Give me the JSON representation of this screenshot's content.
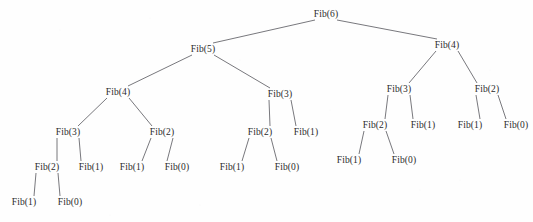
{
  "diagram": {
    "type": "recursion-tree",
    "background_color": "#fefefe",
    "text_color": "#2b2b2b",
    "edge_color": "#56565c",
    "nodes": [
      {
        "id": "n0",
        "label": "Fib(6)",
        "x": 326,
        "y": 14,
        "level": 0
      },
      {
        "id": "n1",
        "label": "Fib(5)",
        "x": 203,
        "y": 49,
        "level": 1
      },
      {
        "id": "n2",
        "label": "Fib(4)",
        "x": 447,
        "y": 45,
        "level": 1
      },
      {
        "id": "n3",
        "label": "Fib(4)",
        "x": 118,
        "y": 92,
        "level": 2
      },
      {
        "id": "n4",
        "label": "Fib(3)",
        "x": 280,
        "y": 94,
        "level": 2
      },
      {
        "id": "n5",
        "label": "Fib(3)",
        "x": 399,
        "y": 89,
        "level": 2
      },
      {
        "id": "n6",
        "label": "Fib(2)",
        "x": 487,
        "y": 89,
        "level": 2
      },
      {
        "id": "n7",
        "label": "Fib(3)",
        "x": 68,
        "y": 132,
        "level": 3
      },
      {
        "id": "n8",
        "label": "Fib(2)",
        "x": 162,
        "y": 132,
        "level": 3
      },
      {
        "id": "n9",
        "label": "Fib(2)",
        "x": 260,
        "y": 132,
        "level": 3
      },
      {
        "id": "n10",
        "label": "Fib(1)",
        "x": 306,
        "y": 132,
        "level": 3
      },
      {
        "id": "n11",
        "label": "Fib(2)",
        "x": 375,
        "y": 125,
        "level": 3
      },
      {
        "id": "n12",
        "label": "Fib(1)",
        "x": 423,
        "y": 125,
        "level": 3
      },
      {
        "id": "n13",
        "label": "Fib(1)",
        "x": 470,
        "y": 125,
        "level": 3
      },
      {
        "id": "n14",
        "label": "Fib(0)",
        "x": 516,
        "y": 125,
        "level": 3
      },
      {
        "id": "n15",
        "label": "Fib(2)",
        "x": 47,
        "y": 167,
        "level": 4
      },
      {
        "id": "n16",
        "label": "Fib(1)",
        "x": 91,
        "y": 167,
        "level": 4
      },
      {
        "id": "n17",
        "label": "Fib(1)",
        "x": 132,
        "y": 167,
        "level": 4
      },
      {
        "id": "n18",
        "label": "Fib(0)",
        "x": 177,
        "y": 167,
        "level": 4
      },
      {
        "id": "n19",
        "label": "Fib(1)",
        "x": 232,
        "y": 167,
        "level": 4
      },
      {
        "id": "n20",
        "label": "Fib(0)",
        "x": 287,
        "y": 167,
        "level": 4
      },
      {
        "id": "n21",
        "label": "Fib(1)",
        "x": 349,
        "y": 160,
        "level": 4
      },
      {
        "id": "n22",
        "label": "Fib(0)",
        "x": 404,
        "y": 160,
        "level": 4
      },
      {
        "id": "n23",
        "label": "Fib(1)",
        "x": 24,
        "y": 202,
        "level": 5
      },
      {
        "id": "n24",
        "label": "Fib(0)",
        "x": 70,
        "y": 202,
        "level": 5
      }
    ],
    "edges": [
      {
        "from": "n0",
        "to": "n1"
      },
      {
        "from": "n0",
        "to": "n2"
      },
      {
        "from": "n1",
        "to": "n3"
      },
      {
        "from": "n1",
        "to": "n4"
      },
      {
        "from": "n2",
        "to": "n5"
      },
      {
        "from": "n2",
        "to": "n6"
      },
      {
        "from": "n3",
        "to": "n7"
      },
      {
        "from": "n3",
        "to": "n8"
      },
      {
        "from": "n4",
        "to": "n9"
      },
      {
        "from": "n4",
        "to": "n10"
      },
      {
        "from": "n5",
        "to": "n11"
      },
      {
        "from": "n5",
        "to": "n12"
      },
      {
        "from": "n6",
        "to": "n13"
      },
      {
        "from": "n6",
        "to": "n14"
      },
      {
        "from": "n7",
        "to": "n15"
      },
      {
        "from": "n7",
        "to": "n16"
      },
      {
        "from": "n8",
        "to": "n17"
      },
      {
        "from": "n8",
        "to": "n18"
      },
      {
        "from": "n9",
        "to": "n19"
      },
      {
        "from": "n9",
        "to": "n20"
      },
      {
        "from": "n11",
        "to": "n21"
      },
      {
        "from": "n11",
        "to": "n22"
      },
      {
        "from": "n15",
        "to": "n23"
      },
      {
        "from": "n15",
        "to": "n24"
      }
    ]
  }
}
